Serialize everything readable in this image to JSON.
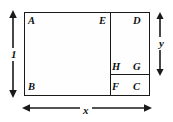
{
  "figure": {
    "stroke_color": "#1a1a1a",
    "background_color": "#ffffff",
    "vertices": [
      {
        "id": "A",
        "label": "A",
        "position": "top-left"
      },
      {
        "id": "E",
        "label": "E",
        "position": "top-middle-right"
      },
      {
        "id": "D",
        "label": "D",
        "position": "top-right"
      },
      {
        "id": "H",
        "label": "H",
        "position": "middle-right-left"
      },
      {
        "id": "G",
        "label": "G",
        "position": "middle-right"
      },
      {
        "id": "B",
        "label": "B",
        "position": "bottom-left"
      },
      {
        "id": "F",
        "label": "F",
        "position": "bottom-middle-right"
      },
      {
        "id": "C",
        "label": "C",
        "position": "bottom-right"
      }
    ],
    "dimensions": [
      {
        "id": "height",
        "label": "1",
        "orientation": "vertical",
        "side": "left",
        "arrowheads": "both"
      },
      {
        "id": "width",
        "label": "x",
        "orientation": "horizontal",
        "side": "bottom",
        "arrowheads": "both"
      },
      {
        "id": "y",
        "label": "y",
        "orientation": "vertical",
        "side": "right",
        "arrowheads": "both"
      }
    ]
  }
}
